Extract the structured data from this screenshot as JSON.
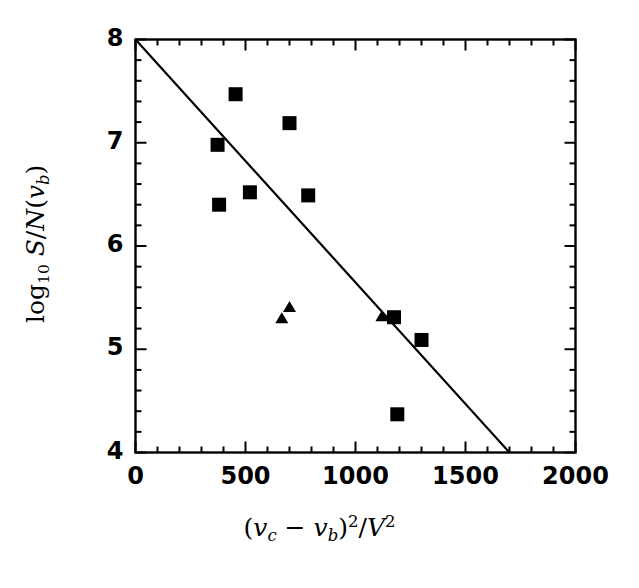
{
  "chart_data": {
    "type": "scatter",
    "title": "",
    "xlabel": "(v_c - v_b)^2 / V^2",
    "ylabel": "log10 S/N(v_b)",
    "xlim": [
      0,
      2000
    ],
    "ylim": [
      4,
      8
    ],
    "grid": false,
    "legend": "none",
    "xticks": [
      0,
      500,
      1000,
      1500,
      2000
    ],
    "xtick_labels": [
      "0",
      "500",
      "1000",
      "1500",
      "2000"
    ],
    "yticks": [
      4,
      5,
      6,
      7,
      8
    ],
    "ytick_labels": [
      "4",
      "5",
      "6",
      "7",
      "8"
    ],
    "minor_tick_interval_x": 100,
    "minor_tick_interval_y": 0.2,
    "series": [
      {
        "name": "squares",
        "marker": "square",
        "color": "#000000",
        "points": [
          {
            "x": 373,
            "y": 6.98
          },
          {
            "x": 380,
            "y": 6.4
          },
          {
            "x": 455,
            "y": 7.47
          },
          {
            "x": 520,
            "y": 6.52
          },
          {
            "x": 700,
            "y": 7.19
          },
          {
            "x": 785,
            "y": 6.49
          },
          {
            "x": 1175,
            "y": 5.31
          },
          {
            "x": 1300,
            "y": 5.09
          },
          {
            "x": 1190,
            "y": 4.37
          }
        ]
      },
      {
        "name": "triangles",
        "marker": "triangle",
        "color": "#000000",
        "points": [
          {
            "x": 665,
            "y": 5.3
          },
          {
            "x": 700,
            "y": 5.41
          },
          {
            "x": 1120,
            "y": 5.32
          }
        ]
      }
    ],
    "fit_line": {
      "name": "linear-fit",
      "color": "#000000",
      "x_start": 0,
      "y_start": 8.0,
      "x_end": 1700,
      "y_end": 4.0,
      "slope": -0.00235,
      "intercept": 8.0
    }
  },
  "axes": {
    "ylabel_parts": {
      "log": "log",
      "log_sub": "10",
      "s": "S",
      "slash": "/",
      "n": "N",
      "paren_open": "(",
      "v": "v",
      "v_sub": "b",
      "paren_close": ")"
    },
    "xlabel_parts": {
      "paren_open": "(",
      "v1": "v",
      "v1_sub": "c",
      "minus": "−",
      "v2": "v",
      "v2_sub": "b",
      "paren_close": ")",
      "sq1": "2",
      "slash": "/",
      "vcap": "V",
      "sq2": "2"
    }
  }
}
